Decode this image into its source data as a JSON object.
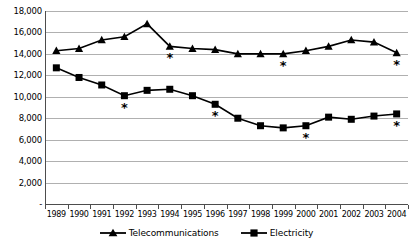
{
  "chart_data": {
    "type": "line",
    "title": "",
    "subtitle": "",
    "xlabel": "",
    "ylabel": "",
    "categories": [
      "1989",
      "1990",
      "1991",
      "1992",
      "1993",
      "1994",
      "1995",
      "1996",
      "1997",
      "1998",
      "1999",
      "2000",
      "2001",
      "2002",
      "2003",
      "2004"
    ],
    "ylim": [
      0,
      18000
    ],
    "ytick_labels": [
      "18,000",
      "16,000",
      "14,000",
      "12,000",
      "10,000",
      "8,000",
      "6,000",
      "4,000",
      "2,000",
      "-"
    ],
    "ytick_values": [
      18000,
      16000,
      14000,
      12000,
      10000,
      8000,
      6000,
      4000,
      2000,
      0
    ],
    "grid": true,
    "legend_position": "bottom",
    "series": [
      {
        "name": "Telecommunications",
        "marker": "triangle",
        "color": "#000000",
        "values": [
          14300,
          14500,
          15300,
          15600,
          16800,
          14700,
          14500,
          14400,
          14000,
          14000,
          14000,
          14300,
          14700,
          15300,
          15100,
          14100
        ]
      },
      {
        "name": "Electricity",
        "marker": "square",
        "color": "#000000",
        "values": [
          12700,
          11800,
          11100,
          10100,
          10600,
          10700,
          10100,
          9300,
          8000,
          7300,
          7100,
          7300,
          8100,
          7900,
          8200,
          8400
        ]
      }
    ],
    "annotations": [
      {
        "label": "*",
        "series": "Telecommunications",
        "category": "1994"
      },
      {
        "label": "*",
        "series": "Telecommunications",
        "category": "1999"
      },
      {
        "label": "*",
        "series": "Telecommunications",
        "category": "2004"
      },
      {
        "label": "*",
        "series": "Electricity",
        "category": "1992"
      },
      {
        "label": "*",
        "series": "Electricity",
        "category": "1996"
      },
      {
        "label": "*",
        "series": "Electricity",
        "category": "2000"
      },
      {
        "label": "*",
        "series": "Electricity",
        "category": "2004"
      }
    ]
  },
  "legend": {
    "items": [
      {
        "label": "Telecommunications",
        "marker": "triangle"
      },
      {
        "label": "Electricity",
        "marker": "square"
      }
    ]
  }
}
